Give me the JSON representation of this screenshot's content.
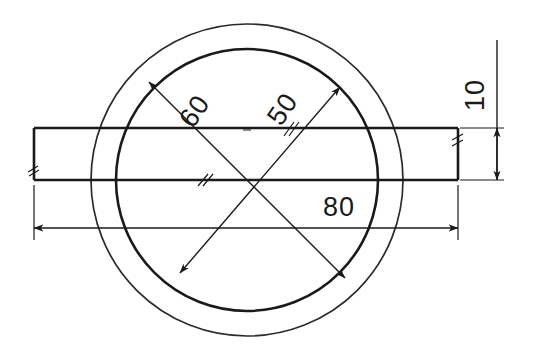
{
  "drawing": {
    "title": "Ring and bar technical drawing",
    "type": "engineering-sketch",
    "background_color": "#ffffff",
    "line_color": "#1a1a1a",
    "units": "mm",
    "geometry": {
      "center": {
        "x": 247,
        "y": 180
      },
      "outer_circle": {
        "cx": 247,
        "cy": 180,
        "r": 156,
        "label": "60"
      },
      "inner_circle": {
        "cx": 247,
        "cy": 180,
        "r": 131,
        "label": "50"
      },
      "bar": {
        "x": 34,
        "y": 128,
        "width": 424,
        "height": 52,
        "label": "10"
      }
    }
  },
  "dimensions": [
    {
      "id": "dia-60",
      "value": "60",
      "kind": "diameter",
      "target": "outer-circle",
      "orientation": "diagonal",
      "rotation_deg": -56
    },
    {
      "id": "dia-50",
      "value": "50",
      "kind": "diameter",
      "target": "inner-circle",
      "orientation": "diagonal",
      "rotation_deg": -56
    },
    {
      "id": "len-80",
      "value": "80",
      "kind": "linear-horizontal",
      "target": "bar-length",
      "orientation": "horizontal",
      "rotation_deg": 0
    },
    {
      "id": "hgt-10",
      "value": "10",
      "kind": "linear-vertical",
      "target": "bar-height",
      "orientation": "vertical",
      "rotation_deg": -90
    }
  ],
  "labels": {
    "dia60": "60",
    "dia50": "50",
    "len80": "80",
    "hgt10": "10"
  }
}
